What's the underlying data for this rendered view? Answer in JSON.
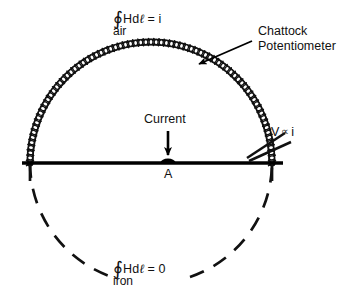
{
  "figure": {
    "title_text": "Chattock Potentiometer magnetic circuit diagram",
    "background_color": "#ffffff",
    "ink_color": "#000000"
  },
  "labels": {
    "air_path": {
      "integral_symbol": "∮",
      "expression": "Hd",
      "ell": "ℓ",
      "equals_value": "= i",
      "medium": "air"
    },
    "iron_path": {
      "integral_symbol": "∮",
      "expression": "Hd",
      "ell": "ℓ",
      "equals_value": "= 0",
      "medium": "iron"
    },
    "chattock": {
      "line1": "Chattock",
      "line2": "Potentiometer"
    },
    "current": "Current",
    "point_a": "A",
    "voltage": {
      "symbol": "V",
      "proportional": "∝",
      "variable": "i"
    }
  },
  "elements": {
    "coil_name": "chattock-coil-arc",
    "baseline_name": "iron-surface-line",
    "dashed_arc_name": "iron-return-path",
    "conductor_name": "current-carrying-conductor",
    "leads_name": "coil-output-leads",
    "pointer_name": "chattock-pointer-arrow",
    "current_arrow_name": "current-direction-arrow"
  },
  "geometry": {
    "baseline_y": 163,
    "baseline_x_start": 22,
    "baseline_x_end": 283,
    "circle_center_x": 151,
    "circle_center_y": 163,
    "circle_radius": 121,
    "coil_turns": 74,
    "conductor_x": 168,
    "conductor_y": 163
  }
}
